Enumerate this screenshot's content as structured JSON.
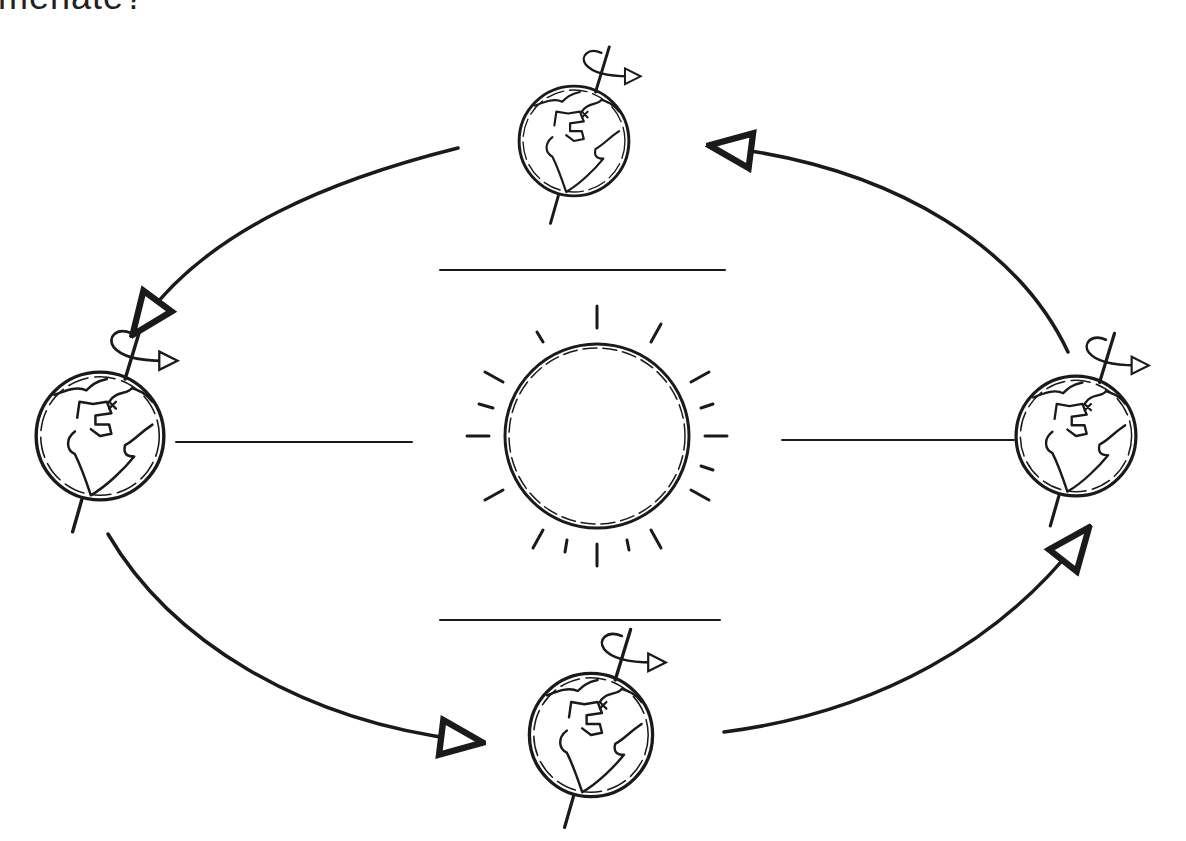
{
  "diagram": {
    "title_fragment": "menate?",
    "type": "earth-orbit-sketch",
    "sun": {
      "label": "",
      "center": [
        597,
        436
      ],
      "radius": 92,
      "rays": 16
    },
    "earths": [
      {
        "position": "top",
        "center": [
          574,
          141
        ],
        "radius": 55
      },
      {
        "position": "left",
        "center": [
          100,
          436
        ],
        "radius": 64
      },
      {
        "position": "right",
        "center": [
          1076,
          436
        ],
        "radius": 60
      },
      {
        "position": "bottom",
        "center": [
          591,
          735
        ],
        "radius": 62
      }
    ],
    "separator_lines": [
      "top",
      "bottom",
      "left",
      "right"
    ],
    "orbit_arrows": [
      "top-to-left",
      "left-to-bottom",
      "bottom-to-right",
      "right-to-top"
    ],
    "colors": {
      "ink": "#1a1a1a",
      "background": "#ffffff"
    }
  }
}
